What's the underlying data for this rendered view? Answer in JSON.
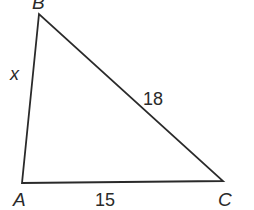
{
  "diagram": {
    "type": "triangle",
    "vertices": {
      "A": {
        "label": "A",
        "x": 22,
        "y": 183
      },
      "B": {
        "label": "B",
        "x": 39,
        "y": 14
      },
      "C": {
        "label": "C",
        "x": 223,
        "y": 181
      }
    },
    "sides": {
      "AB": {
        "label": "x"
      },
      "BC": {
        "label": "18"
      },
      "AC": {
        "label": "15"
      }
    },
    "colors": {
      "stroke": "#2a2a2a",
      "background": "#ffffff"
    }
  }
}
